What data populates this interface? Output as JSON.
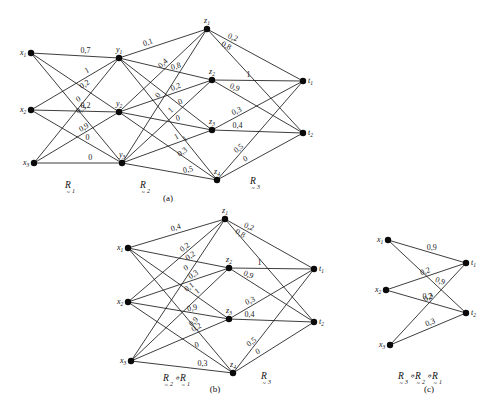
{
  "figure": {
    "background": "#ffffff",
    "ink": "#111111",
    "width": 499,
    "height": 415
  },
  "panels": [
    {
      "id": "a",
      "caption": "(a)",
      "nodes": [
        {
          "id": "x1",
          "base": "x",
          "sub": "1",
          "x": 31,
          "y": 53,
          "lx": -11,
          "ly": 2,
          "col": "x"
        },
        {
          "id": "x2",
          "base": "x",
          "sub": "2",
          "x": 31,
          "y": 110,
          "lx": -11,
          "ly": 2,
          "col": "x"
        },
        {
          "id": "x3",
          "base": "x",
          "sub": "3",
          "x": 34,
          "y": 163,
          "lx": -11,
          "ly": 2,
          "col": "x"
        },
        {
          "id": "y1",
          "base": "y",
          "sub": "1",
          "x": 119,
          "y": 58,
          "lx": -3,
          "ly": -6,
          "col": "y"
        },
        {
          "id": "y2",
          "base": "y",
          "sub": "2",
          "x": 119,
          "y": 112,
          "lx": -3,
          "ly": -6,
          "col": "y"
        },
        {
          "id": "y3",
          "base": "y",
          "sub": "3",
          "x": 122,
          "y": 163,
          "lx": -3,
          "ly": -6,
          "col": "y"
        },
        {
          "id": "z1",
          "base": "z",
          "sub": "1",
          "x": 207,
          "y": 29,
          "lx": -3,
          "ly": -6,
          "col": "z"
        },
        {
          "id": "z2",
          "base": "z",
          "sub": "2",
          "x": 212,
          "y": 80,
          "lx": -3,
          "ly": -6,
          "col": "z"
        },
        {
          "id": "z3",
          "base": "z",
          "sub": "3",
          "x": 212,
          "y": 130,
          "lx": -3,
          "ly": -6,
          "col": "z"
        },
        {
          "id": "z4",
          "base": "z",
          "sub": "4",
          "x": 217,
          "y": 180,
          "lx": -3,
          "ly": -6,
          "col": "z"
        },
        {
          "id": "t1",
          "base": "t",
          "sub": "1",
          "x": 303,
          "y": 81,
          "lx": 5,
          "ly": 2,
          "col": "t"
        },
        {
          "id": "t2",
          "base": "t",
          "sub": "2",
          "x": 303,
          "y": 133,
          "lx": 5,
          "ly": 2,
          "col": "t"
        }
      ],
      "edges": [
        {
          "from": "x1",
          "to": "y1",
          "label": "0,7",
          "lt": 0.62,
          "dx": 0,
          "dy": -3,
          "rot": 0
        },
        {
          "from": "x1",
          "to": "y2",
          "label": "0,2",
          "lt": 0.6,
          "dx": 2,
          "dy": -2,
          "rot": -32
        },
        {
          "from": "x1",
          "to": "y3",
          "label": "0,3",
          "lt": 0.54,
          "dx": 2,
          "dy": -1,
          "rot": -32
        },
        {
          "from": "x2",
          "to": "y1",
          "label": "1",
          "lt": 0.66,
          "dx": -1,
          "dy": -3,
          "rot": -28
        },
        {
          "from": "x2",
          "to": "y2",
          "label": "0,2",
          "lt": 0.62,
          "dx": 0,
          "dy": -3,
          "rot": 0
        },
        {
          "from": "x2",
          "to": "y3",
          "label": "0",
          "lt": 0.62,
          "dx": 0,
          "dy": -3,
          "rot": 0
        },
        {
          "from": "x3",
          "to": "y1",
          "label": "0",
          "lt": 0.56,
          "dx": -2,
          "dy": -3,
          "rot": -30
        },
        {
          "from": "x3",
          "to": "y2",
          "label": "0,9",
          "lt": 0.6,
          "dx": 0,
          "dy": -3,
          "rot": -30
        },
        {
          "from": "x3",
          "to": "y3",
          "label": "0",
          "lt": 0.64,
          "dx": 0,
          "dy": -3,
          "rot": 0
        },
        {
          "from": "y1",
          "to": "z1",
          "label": "0,1",
          "lt": 0.36,
          "dx": -2,
          "dy": -3,
          "rot": -20
        },
        {
          "from": "y1",
          "to": "z2",
          "label": "0,8",
          "lt": 0.62,
          "dx": 0,
          "dy": -3,
          "rot": -16
        },
        {
          "from": "y1",
          "to": "z3",
          "label": "0",
          "lt": 0.68,
          "dx": -1,
          "dy": -3,
          "rot": -26
        },
        {
          "from": "y1",
          "to": "z4",
          "label": "1",
          "lt": 0.7,
          "dx": -1,
          "dy": -3,
          "rot": -40
        },
        {
          "from": "y2",
          "to": "z1",
          "label": "0,4",
          "lt": 0.54,
          "dx": -2,
          "dy": -2,
          "rot": -42
        },
        {
          "from": "y2",
          "to": "z2",
          "label": "0,2",
          "lt": 0.62,
          "dx": 0,
          "dy": -3,
          "rot": -22
        },
        {
          "from": "y2",
          "to": "z3",
          "label": "0",
          "lt": 0.64,
          "dx": 0,
          "dy": -3,
          "rot": -14
        },
        {
          "from": "y2",
          "to": "z4",
          "label": "0,3",
          "lt": 0.66,
          "dx": 0,
          "dy": -3,
          "rot": -34
        },
        {
          "from": "y3",
          "to": "z1",
          "label": "0",
          "lt": 0.48,
          "dx": -3,
          "dy": -2,
          "rot": -52
        },
        {
          "from": "y3",
          "to": "z2",
          "label": "1",
          "lt": 0.58,
          "dx": -2,
          "dy": -3,
          "rot": -42
        },
        {
          "from": "y3",
          "to": "z3",
          "label": "1",
          "lt": 0.64,
          "dx": -2,
          "dy": -3,
          "rot": -28
        },
        {
          "from": "y3",
          "to": "z4",
          "label": "0,5",
          "lt": 0.7,
          "dx": 0,
          "dy": -3,
          "rot": -12
        },
        {
          "from": "z1",
          "to": "t1",
          "label": "0,2",
          "lt": 0.26,
          "dx": 0,
          "dy": -3,
          "rot": 22
        },
        {
          "from": "z1",
          "to": "t2",
          "label": "0,8",
          "lt": 0.2,
          "dx": -1,
          "dy": -2,
          "rot": 28
        },
        {
          "from": "z2",
          "to": "t1",
          "label": "1",
          "lt": 0.4,
          "dx": 0,
          "dy": -3,
          "rot": 0
        },
        {
          "from": "z2",
          "to": "t2",
          "label": "0,9",
          "lt": 0.24,
          "dx": 0,
          "dy": -3,
          "rot": 22
        },
        {
          "from": "z3",
          "to": "t1",
          "label": "0,3",
          "lt": 0.28,
          "dx": 0,
          "dy": -3,
          "rot": -24
        },
        {
          "from": "z3",
          "to": "t2",
          "label": "0,4",
          "lt": 0.28,
          "dx": 0,
          "dy": -3,
          "rot": 0
        },
        {
          "from": "z4",
          "to": "t1",
          "label": "0,5",
          "lt": 0.28,
          "dx": -1,
          "dy": -2,
          "rot": -38
        },
        {
          "from": "z4",
          "to": "t2",
          "label": "0",
          "lt": 0.34,
          "dx": 0,
          "dy": -3,
          "rot": -24
        }
      ],
      "relations": [
        {
          "base": "R",
          "sub": "1",
          "x": 65,
          "y": 188
        },
        {
          "base": "R",
          "sub": "2",
          "x": 140,
          "y": 188
        },
        {
          "base": "R",
          "sub": "3",
          "x": 250,
          "y": 184
        }
      ],
      "caption_x": 168,
      "caption_y": 201
    },
    {
      "id": "b",
      "caption": "(b)",
      "nodes": [
        {
          "id": "x1",
          "base": "x",
          "sub": "1",
          "x": 128,
          "y": 248,
          "lx": -11,
          "ly": 2,
          "col": "x"
        },
        {
          "id": "x2",
          "base": "x",
          "sub": "2",
          "x": 128,
          "y": 302,
          "lx": -11,
          "ly": 2,
          "col": "x"
        },
        {
          "id": "x3",
          "base": "x",
          "sub": "3",
          "x": 131,
          "y": 361,
          "lx": -11,
          "ly": 2,
          "col": "x"
        },
        {
          "id": "z1",
          "base": "z",
          "sub": "1",
          "x": 225,
          "y": 219,
          "lx": -3,
          "ly": -6,
          "col": "z"
        },
        {
          "id": "z2",
          "base": "z",
          "sub": "2",
          "x": 229,
          "y": 268,
          "lx": -3,
          "ly": -6,
          "col": "z"
        },
        {
          "id": "z3",
          "base": "z",
          "sub": "3",
          "x": 229,
          "y": 319,
          "lx": -3,
          "ly": -6,
          "col": "z"
        },
        {
          "id": "z4",
          "base": "z",
          "sub": "4",
          "x": 233,
          "y": 373,
          "lx": -3,
          "ly": -6,
          "col": "z"
        },
        {
          "id": "t1",
          "base": "t",
          "sub": "1",
          "x": 314,
          "y": 269,
          "lx": 5,
          "ly": 2,
          "col": "t"
        },
        {
          "id": "t2",
          "base": "t",
          "sub": "2",
          "x": 314,
          "y": 322,
          "lx": 5,
          "ly": 2,
          "col": "t"
        }
      ],
      "edges": [
        {
          "from": "x1",
          "to": "z1",
          "label": "0,4",
          "lt": 0.52,
          "dx": -2,
          "dy": -3,
          "rot": -18
        },
        {
          "from": "x1",
          "to": "z2",
          "label": "0,2",
          "lt": 0.64,
          "dx": -1,
          "dy": -3,
          "rot": -34
        },
        {
          "from": "x1",
          "to": "z3",
          "label": "0,1",
          "lt": 0.62,
          "dx": 0,
          "dy": -3,
          "rot": -38
        },
        {
          "from": "x1",
          "to": "z4",
          "label": "0,9",
          "lt": 0.62,
          "dx": 2,
          "dy": -2,
          "rot": -42
        },
        {
          "from": "x2",
          "to": "z1",
          "label": "0,2",
          "lt": 0.6,
          "dx": 0,
          "dy": -3,
          "rot": -38
        },
        {
          "from": "x2",
          "to": "z2",
          "label": "0,3",
          "lt": 0.66,
          "dx": 0,
          "dy": -3,
          "rot": -34
        },
        {
          "from": "x2",
          "to": "z3",
          "label": "0,9",
          "lt": 0.66,
          "dx": -2,
          "dy": -3,
          "rot": -14
        },
        {
          "from": "x2",
          "to": "z4",
          "label": "0",
          "lt": 0.68,
          "dx": -2,
          "dy": -3,
          "rot": -16
        },
        {
          "from": "x3",
          "to": "z1",
          "label": "0",
          "lt": 0.62,
          "dx": -2,
          "dy": -3,
          "rot": -32
        },
        {
          "from": "x3",
          "to": "z2",
          "label": "1",
          "lt": 0.7,
          "dx": -1,
          "dy": -3,
          "rot": -38
        },
        {
          "from": "x3",
          "to": "z3",
          "label": "0,2",
          "lt": 0.68,
          "dx": 0,
          "dy": -3,
          "rot": -30
        },
        {
          "from": "x3",
          "to": "z4",
          "label": "0,3",
          "lt": 0.7,
          "dx": 0,
          "dy": -3,
          "rot": 0
        },
        {
          "from": "z1",
          "to": "t1",
          "label": "0,2",
          "lt": 0.26,
          "dx": 0,
          "dy": -3,
          "rot": 22
        },
        {
          "from": "z1",
          "to": "t2",
          "label": "0,8",
          "lt": 0.18,
          "dx": -2,
          "dy": -2,
          "rot": 30
        },
        {
          "from": "z2",
          "to": "t1",
          "label": "1",
          "lt": 0.36,
          "dx": 0,
          "dy": -3,
          "rot": 0
        },
        {
          "from": "z2",
          "to": "t2",
          "label": "0,9",
          "lt": 0.22,
          "dx": 0,
          "dy": -3,
          "rot": 22
        },
        {
          "from": "z3",
          "to": "t1",
          "label": "0,3",
          "lt": 0.26,
          "dx": 0,
          "dy": -3,
          "rot": -24
        },
        {
          "from": "z3",
          "to": "t2",
          "label": "0,4",
          "lt": 0.24,
          "dx": 0,
          "dy": -3,
          "rot": 0
        },
        {
          "from": "z4",
          "to": "t1",
          "label": "0,5",
          "lt": 0.26,
          "dx": -1,
          "dy": -2,
          "rot": -38
        },
        {
          "from": "z4",
          "to": "t2",
          "label": "0",
          "lt": 0.32,
          "dx": 0,
          "dy": -3,
          "rot": -26
        }
      ],
      "relations": [
        {
          "base": "R",
          "sub": "2",
          "x": 163,
          "y": 381,
          "compose": "∘",
          "base2": "R",
          "sub2": "1"
        },
        {
          "base": "R",
          "sub": "3",
          "x": 261,
          "y": 379
        }
      ],
      "caption_x": 215,
      "caption_y": 392
    },
    {
      "id": "c",
      "caption": "(c)",
      "nodes": [
        {
          "id": "x1",
          "base": "x",
          "sub": "1",
          "x": 388,
          "y": 240,
          "lx": -11,
          "ly": 2,
          "col": "x"
        },
        {
          "id": "x2",
          "base": "x",
          "sub": "2",
          "x": 386,
          "y": 290,
          "lx": -11,
          "ly": 2,
          "col": "x"
        },
        {
          "id": "x3",
          "base": "x",
          "sub": "3",
          "x": 390,
          "y": 345,
          "lx": -11,
          "ly": 2,
          "col": "x"
        },
        {
          "id": "t1",
          "base": "t",
          "sub": "1",
          "x": 466,
          "y": 263,
          "lx": 5,
          "ly": 2,
          "col": "t"
        },
        {
          "id": "t2",
          "base": "t",
          "sub": "2",
          "x": 466,
          "y": 313,
          "lx": 5,
          "ly": 2,
          "col": "t"
        }
      ],
      "edges": [
        {
          "from": "x1",
          "to": "t1",
          "label": "0,9",
          "lt": 0.56,
          "dx": 0,
          "dy": -3,
          "rot": 0
        },
        {
          "from": "x2",
          "to": "t1",
          "label": "0,2",
          "lt": 0.5,
          "dx": 0,
          "dy": -3,
          "rot": -20
        },
        {
          "from": "x3",
          "to": "t1",
          "label": "0,3",
          "lt": 0.52,
          "dx": 0,
          "dy": -3,
          "rot": -32
        },
        {
          "from": "x1",
          "to": "t2",
          "label": "0,9",
          "lt": 0.62,
          "dx": 3,
          "dy": -2,
          "rot": 20
        },
        {
          "from": "x2",
          "to": "t2",
          "label": "0,2",
          "lt": 0.52,
          "dx": 0,
          "dy": -3,
          "rot": 0
        },
        {
          "from": "x3",
          "to": "t2",
          "label": "0,3",
          "lt": 0.54,
          "dx": 0,
          "dy": -3,
          "rot": -22
        }
      ],
      "relations": [
        {
          "base": "R",
          "sub": "3",
          "x": 398,
          "y": 379,
          "compose": "∘",
          "base2": "R",
          "sub2": "2",
          "compose2": "∘",
          "base3": "R",
          "sub3": "1"
        }
      ],
      "caption_x": 429,
      "caption_y": 392
    }
  ],
  "relation_data": {
    "R1": {
      "name": "R1",
      "rows": [
        "x1",
        "x2",
        "x3"
      ],
      "cols": [
        "y1",
        "y2",
        "y3"
      ],
      "values": [
        [
          0.7,
          0.2,
          0.3
        ],
        [
          1,
          0.2,
          0
        ],
        [
          0,
          0.9,
          0
        ]
      ]
    },
    "R2": {
      "name": "R2",
      "rows": [
        "y1",
        "y2",
        "y3"
      ],
      "cols": [
        "z1",
        "z2",
        "z3",
        "z4"
      ],
      "values": [
        [
          0.1,
          0.8,
          0,
          1
        ],
        [
          0.4,
          0.2,
          0,
          0.3
        ],
        [
          0,
          1,
          1,
          0.5
        ]
      ]
    },
    "R3": {
      "name": "R3",
      "rows": [
        "z1",
        "z2",
        "z3",
        "z4"
      ],
      "cols": [
        "t1",
        "t2"
      ],
      "values": [
        [
          0.2,
          0.8
        ],
        [
          1,
          0.9
        ],
        [
          0.3,
          0.4
        ],
        [
          0.5,
          0
        ]
      ]
    },
    "R2oR1": {
      "name": "R2∘R1",
      "rows": [
        "x1",
        "x2",
        "x3"
      ],
      "cols": [
        "z1",
        "z2",
        "z3",
        "z4"
      ],
      "values": [
        [
          0.4,
          0.2,
          0.1,
          0.9
        ],
        [
          0.2,
          0.3,
          0.9,
          0
        ],
        [
          0,
          1,
          0.2,
          0.3
        ]
      ]
    },
    "R3oR2oR1": {
      "name": "R3∘R2∘R1",
      "rows": [
        "x1",
        "x2",
        "x3"
      ],
      "cols": [
        "t1",
        "t2"
      ],
      "values": [
        [
          0.9,
          0.9
        ],
        [
          0.2,
          0.2
        ],
        [
          0.3,
          0.3
        ]
      ]
    }
  }
}
